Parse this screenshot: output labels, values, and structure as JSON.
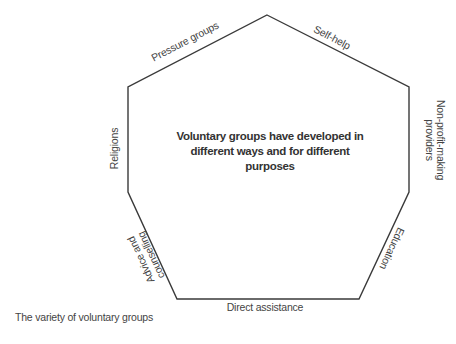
{
  "diagram": {
    "center_text": {
      "line1": "Voluntary groups have developed in",
      "line2": "different ways and for different",
      "line3": "purposes"
    },
    "sides": [
      {
        "id": "pressure-groups",
        "label": "Pressure groups"
      },
      {
        "id": "self-help",
        "label": "Self-help"
      },
      {
        "id": "non-profit-making-providers",
        "line1": "Non-profit-making",
        "line2": "providers"
      },
      {
        "id": "education",
        "label": "Education"
      },
      {
        "id": "direct-assistance",
        "label": "Direct assistance"
      },
      {
        "id": "advice-and-counselling",
        "line1": "Advice and",
        "line2": "counselling"
      },
      {
        "id": "religions",
        "label": "Religions"
      }
    ],
    "caption": "The variety of voluntary groups",
    "stroke_color": "#3a3a3a"
  }
}
